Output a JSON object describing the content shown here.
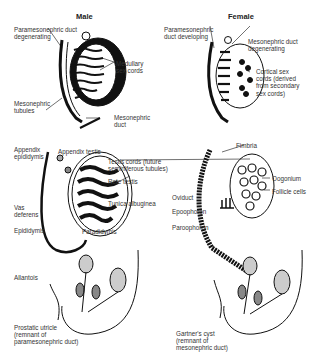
{
  "titles": {
    "male": "Male",
    "female": "Female"
  },
  "male": {
    "stage1": {
      "paramesonephric": "Paramesonephric duct\ndegenerating",
      "medullary": "Medullary\nsex cords",
      "tubules": "Mesonephric\ntubules",
      "duct": "Mesonephric\nduct"
    },
    "stage2": {
      "appendix_epididymis": "Appendix\nepididymis",
      "appendix_testis": "Appendix testis",
      "testis_cords": "Testis cords (future\nseminiferous tubules)",
      "rete_testis": "Rete testis",
      "tunica": "Tunica albuginea",
      "vas": "Vas\ndeferens",
      "epididymis": "Epididymis",
      "paradidymis": "Paradidymis"
    },
    "stage3": {
      "allantois": "Allantois",
      "prostatic": "Prostatic utricle\n(remnant of\nparamesonephric duct)"
    }
  },
  "female": {
    "stage1": {
      "paramesonephric": "Paramesonephric\nduct developing",
      "mesonephric": "Mesonephric duct\ndegenerating",
      "cortical": "Cortical sex\ncords (derived\nfrom secondary\nsex cords)"
    },
    "stage2": {
      "fimbria": "Fimbria",
      "oogonium": "Oogonium",
      "follicle": "Follicle cells",
      "oviduct": "Oviduct",
      "epoophoron": "Epoophoron",
      "paroophoron": "Paroophoron"
    },
    "stage3": {
      "gartner": "Gartner's cyst\n(remnant of\nmesonephric duct)"
    }
  }
}
